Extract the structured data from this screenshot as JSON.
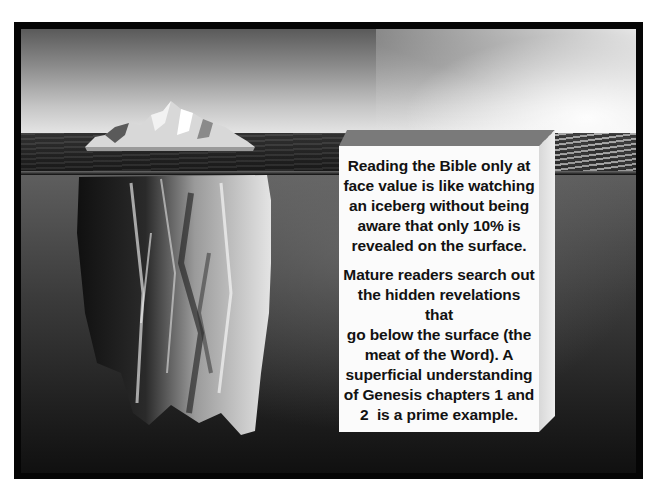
{
  "slide": {
    "image_description": "iceberg-above-and-below-waterline",
    "text_box": {
      "paragraphs": [
        {
          "lines": [
            "Reading the Bible only at",
            "face value is like watching",
            "an iceberg without being",
            "aware that only 10% is",
            "revealed on the surface."
          ]
        },
        {
          "lines": [
            "Mature readers search out",
            "the hidden revelations that",
            "go below the surface (the",
            "meat of the Word). A",
            "superficial understanding",
            "of Genesis chapters 1 and",
            "2  is a prime example."
          ]
        }
      ]
    },
    "colors": {
      "frame": "#050505",
      "box_front": "#fbfbfb",
      "box_top": "#7a7a7a",
      "text": "#121212"
    }
  }
}
